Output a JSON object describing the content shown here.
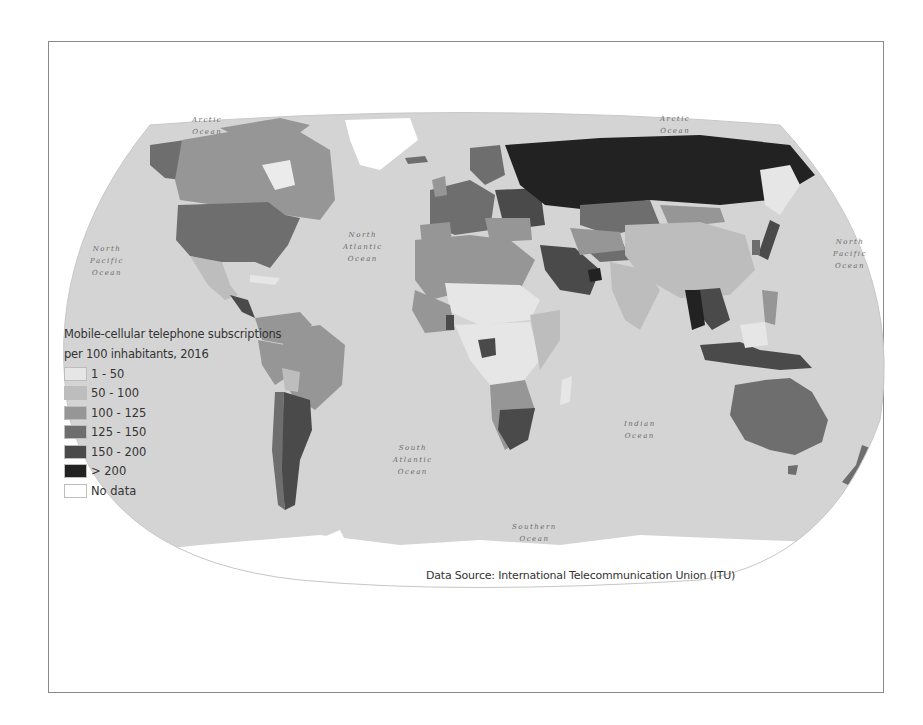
{
  "map": {
    "title": "Mobile-cellular telephone subscriptions per 100 inhabitants, 2016",
    "legend": {
      "title_line1": "Mobile-cellular telephone subscriptions",
      "title_line2": "per 100 inhabitants, 2016",
      "items": [
        {
          "label": "1 - 50",
          "color": "#e6e6e6"
        },
        {
          "label": "50 - 100",
          "color": "#bdbdbd"
        },
        {
          "label": "100 - 125",
          "color": "#969696"
        },
        {
          "label": "125 -  150",
          "color": "#6e6e6e"
        },
        {
          "label": "150 - 200",
          "color": "#4a4a4a"
        },
        {
          "label": "> 200",
          "color": "#222222"
        },
        {
          "label": "No data",
          "color": "#ffffff"
        }
      ]
    },
    "ocean_labels": [
      {
        "id": "arctic-west",
        "text": "Arctic\nOcean"
      },
      {
        "id": "arctic-east",
        "text": "Arctic\nOcean"
      },
      {
        "id": "north-pacific-west",
        "text": "North\nPacific\nOcean"
      },
      {
        "id": "north-pacific-east",
        "text": "North\nPacific\nOcean"
      },
      {
        "id": "north-atlantic",
        "text": "North\nAtlantic\nOcean"
      },
      {
        "id": "south-atlantic",
        "text": "South\nAtlantic\nOcean"
      },
      {
        "id": "indian",
        "text": "Indian\nOcean"
      },
      {
        "id": "southern",
        "text": "Southern\nOcean"
      }
    ],
    "source": "Data Source: International Telecommunication Union (ITU)",
    "colors": {
      "ocean": "#d4d4d4",
      "frame": "#8a8a8a",
      "antarctica": "#ffffff"
    }
  }
}
